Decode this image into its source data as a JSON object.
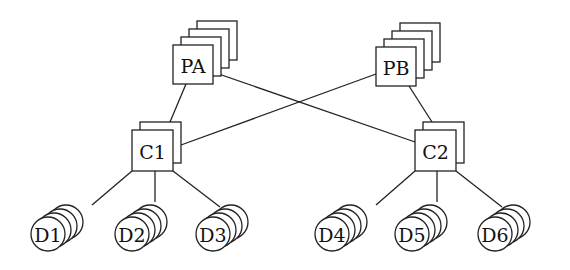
{
  "diagram": {
    "colors": {
      "stroke": "#222222",
      "fill": "#ffffff",
      "text": "#111111"
    },
    "processors": [
      {
        "id": "PA",
        "label": "PA",
        "x": 173,
        "y": 45,
        "w": 40,
        "h": 39,
        "stack": 4,
        "dx": 8,
        "dy": -8
      },
      {
        "id": "PB",
        "label": "PB",
        "x": 376,
        "y": 47,
        "w": 40,
        "h": 39,
        "stack": 4,
        "dx": 8,
        "dy": -8
      }
    ],
    "controllers": [
      {
        "id": "C1",
        "label": "C1",
        "x": 132,
        "y": 130,
        "w": 41,
        "h": 41,
        "stack": 2,
        "dx": 8,
        "dy": -8
      },
      {
        "id": "C2",
        "label": "C2",
        "x": 415,
        "y": 130,
        "w": 41,
        "h": 41,
        "stack": 2,
        "dx": 8,
        "dy": -8
      }
    ],
    "disks": [
      {
        "id": "D1",
        "label": "D1",
        "cx": 48,
        "cy": 234,
        "r": 17,
        "stack": 4,
        "dx": 6,
        "dy": -4
      },
      {
        "id": "D2",
        "label": "D2",
        "cx": 132,
        "cy": 234,
        "r": 17,
        "stack": 4,
        "dx": 6,
        "dy": -4
      },
      {
        "id": "D3",
        "label": "D3",
        "cx": 213,
        "cy": 234,
        "r": 17,
        "stack": 4,
        "dx": 6,
        "dy": -4
      },
      {
        "id": "D4",
        "label": "D4",
        "cx": 332,
        "cy": 234,
        "r": 17,
        "stack": 4,
        "dx": 6,
        "dy": -4
      },
      {
        "id": "D5",
        "label": "D5",
        "cx": 412,
        "cy": 234,
        "r": 17,
        "stack": 4,
        "dx": 6,
        "dy": -4
      },
      {
        "id": "D6",
        "label": "D6",
        "cx": 495,
        "cy": 234,
        "r": 17,
        "stack": 4,
        "dx": 6,
        "dy": -4
      }
    ],
    "edges": [
      {
        "from": "PA",
        "to": "C1",
        "x1": 186,
        "y1": 84,
        "x2": 170,
        "y2": 122
      },
      {
        "from": "PA",
        "to": "C2",
        "x1": 213,
        "y1": 72,
        "x2": 415,
        "y2": 142
      },
      {
        "from": "PB",
        "to": "C1",
        "x1": 376,
        "y1": 74,
        "x2": 181,
        "y2": 145
      },
      {
        "from": "PB",
        "to": "C2",
        "x1": 409,
        "y1": 86,
        "x2": 432,
        "y2": 122
      },
      {
        "from": "C1",
        "to": "D1",
        "x1": 132,
        "y1": 171,
        "x2": 92,
        "y2": 205
      },
      {
        "from": "C1",
        "to": "D2",
        "x1": 155,
        "y1": 171,
        "x2": 155,
        "y2": 202
      },
      {
        "from": "C1",
        "to": "D3",
        "x1": 173,
        "y1": 171,
        "x2": 220,
        "y2": 207
      },
      {
        "from": "C2",
        "to": "D4",
        "x1": 415,
        "y1": 171,
        "x2": 376,
        "y2": 205
      },
      {
        "from": "C2",
        "to": "D5",
        "x1": 437,
        "y1": 171,
        "x2": 437,
        "y2": 202
      },
      {
        "from": "C2",
        "to": "D6",
        "x1": 456,
        "y1": 171,
        "x2": 502,
        "y2": 207
      }
    ]
  }
}
